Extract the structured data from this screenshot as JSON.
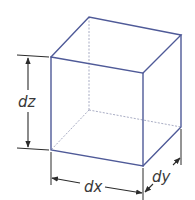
{
  "diagram": {
    "labels": {
      "dx": "dx",
      "dy": "dy",
      "dz": "dz"
    },
    "colors": {
      "edge": "#4f5a98",
      "hidden_edge": "#a9adc4",
      "dimension": "#2b2b2b",
      "label": "#3a3a3a"
    }
  }
}
